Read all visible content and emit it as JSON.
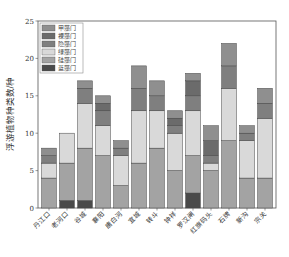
{
  "chart_data": {
    "type": "bar",
    "stacked": true,
    "title": "",
    "xlabel": "",
    "ylabel": "浮游植物种类数/种",
    "ylim": [
      0,
      25
    ],
    "yticks": [
      0,
      5,
      10,
      15,
      20,
      25
    ],
    "grid": false,
    "legend_position": "upper-left",
    "categories": [
      "丹江口",
      "老河口",
      "谷城",
      "襄阳",
      "唐白河",
      "宜城",
      "转斗",
      "钟祥",
      "罗汉闸",
      "红旗码头",
      "石牌",
      "新沟",
      "宗关"
    ],
    "series": [
      {
        "name": "蓝藻门",
        "color": "#4a4a4a",
        "values": [
          0,
          1,
          1,
          0,
          0,
          0,
          0,
          0,
          2,
          0,
          0,
          0,
          0
        ]
      },
      {
        "name": "硅藻门",
        "color": "#a3a3a3",
        "values": [
          4,
          5,
          7,
          7,
          3,
          6,
          8,
          5,
          5,
          5,
          9,
          4,
          4
        ]
      },
      {
        "name": "绿藻门",
        "color": "#d9d9d9",
        "values": [
          2,
          4,
          6,
          4,
          4,
          7,
          5,
          5,
          6,
          1,
          7,
          5,
          8
        ]
      },
      {
        "name": "隐藻门",
        "color": "#7f7f7f",
        "values": [
          1,
          0,
          2,
          2,
          1,
          3,
          2,
          1,
          2,
          1,
          3,
          1,
          2
        ]
      },
      {
        "name": "裸藻门",
        "color": "#6b6b6b",
        "values": [
          0,
          0,
          0,
          1,
          0,
          0,
          0,
          1,
          2,
          2,
          0,
          0,
          0
        ]
      },
      {
        "name": "甲藻门",
        "color": "#8f8f8f",
        "values": [
          1,
          0,
          1,
          1,
          1,
          3,
          2,
          1,
          1,
          2,
          3,
          1,
          2
        ]
      }
    ],
    "totals": [
      8,
      10,
      17,
      15,
      9,
      19,
      17,
      13,
      18,
      11,
      22,
      11,
      16
    ],
    "legend_order": [
      "甲藻门",
      "裸藻门",
      "隐藻门",
      "绿藻门",
      "硅藻门",
      "蓝藻门"
    ]
  }
}
